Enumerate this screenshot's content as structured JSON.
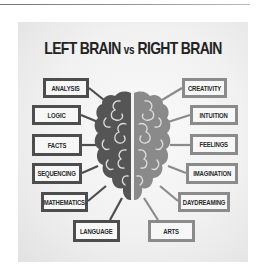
{
  "title": {
    "left": "LEFT BRAIN",
    "vs": "vs",
    "right": "RIGHT BRAIN"
  },
  "colors": {
    "left_hemisphere": "#555555",
    "right_hemisphere": "#8a8a8a",
    "gyri_lines": "#dddddd",
    "left_border": "#4d4d4d",
    "right_border": "#8b8b8b",
    "title": "#232323"
  },
  "left_labels": [
    {
      "label": "ANALYSIS"
    },
    {
      "label": "LOGIC"
    },
    {
      "label": "FACTS"
    },
    {
      "label": "SEQUENCING"
    },
    {
      "label": "MATHEMATICS"
    },
    {
      "label": "LANGUAGE"
    }
  ],
  "right_labels": [
    {
      "label": "CREATIVITY"
    },
    {
      "label": "INTUITION"
    },
    {
      "label": "FEELINGS"
    },
    {
      "label": "IMAGINATION"
    },
    {
      "label": "DAYDREAMING"
    },
    {
      "label": "ARTS"
    }
  ]
}
